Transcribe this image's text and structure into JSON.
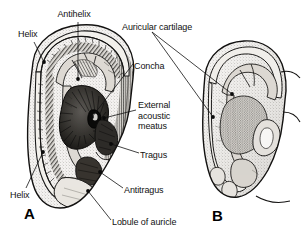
{
  "figure": {
    "background_color": "#ffffff",
    "ink_color": "#111111",
    "width": 305,
    "height": 247
  },
  "panels": [
    {
      "id": "A",
      "letter": "A",
      "caption": "A",
      "view": "lateral surface of auricle with skin removed showing cartilage relief"
    },
    {
      "id": "B",
      "letter": "B",
      "caption": "B",
      "view": "auricular cartilage isolated"
    }
  ],
  "labels": [
    {
      "id": "antihelix",
      "text": "Antihelix",
      "x": 74,
      "y": 9,
      "align": "center"
    },
    {
      "id": "helix-top",
      "text": "Helix",
      "x": 18,
      "y": 29,
      "align": "left"
    },
    {
      "id": "auricular-cartilage",
      "text": "Auricular cartilage",
      "x": 122,
      "y": 22,
      "align": "left"
    },
    {
      "id": "concha",
      "text": "Concha",
      "x": 134,
      "y": 61,
      "align": "left"
    },
    {
      "id": "external-acoustic-meatus",
      "text": "External\nacoustic\nmeatus",
      "x": 138,
      "y": 100,
      "align": "left"
    },
    {
      "id": "tragus",
      "text": "Tragus",
      "x": 140,
      "y": 150,
      "align": "left"
    },
    {
      "id": "antitragus",
      "text": "Antitragus",
      "x": 124,
      "y": 185,
      "align": "left"
    },
    {
      "id": "helix-bottom",
      "text": "Helix",
      "x": 10,
      "y": 190,
      "align": "left"
    },
    {
      "id": "lobule-of-auricle",
      "text": "Lobule of auricle",
      "x": 112,
      "y": 217,
      "align": "left"
    }
  ],
  "leaders": [
    {
      "id": "leader-antihelix",
      "from": [
        78,
        22
      ],
      "to": [
        78,
        79
      ],
      "dot": [
        78,
        79
      ]
    },
    {
      "id": "leader-helix-top",
      "from": [
        34,
        42
      ],
      "to": [
        44,
        62
      ],
      "dot": [
        44,
        62
      ]
    },
    {
      "id": "leader-helix-bottom",
      "from": [
        26,
        188
      ],
      "to": [
        43,
        152
      ],
      "dot": [
        43,
        152
      ]
    },
    {
      "id": "leader-concha",
      "from": [
        133,
        64
      ],
      "to": [
        92,
        117
      ],
      "dot": [
        92,
        117
      ]
    },
    {
      "id": "leader-meatus",
      "from": [
        136,
        110
      ],
      "to": [
        104,
        118
      ],
      "dot": [
        104,
        118
      ]
    },
    {
      "id": "leader-tragus",
      "from": [
        139,
        153
      ],
      "to": [
        111,
        144
      ],
      "dot": [
        111,
        144
      ]
    },
    {
      "id": "leader-antitragus",
      "from": [
        123,
        188
      ],
      "to": [
        100,
        172
      ],
      "dot": [
        100,
        172
      ]
    },
    {
      "id": "leader-lobule",
      "from": [
        111,
        220
      ],
      "to": [
        88,
        191
      ],
      "dot": [
        88,
        191
      ]
    },
    {
      "id": "leader-cartilage-1",
      "from": [
        152,
        32
      ],
      "to": [
        232,
        94
      ],
      "dot": [
        232,
        94
      ]
    },
    {
      "id": "leader-cartilage-2",
      "from": [
        152,
        32
      ],
      "to": [
        213,
        117
      ],
      "dot": [
        213,
        117
      ]
    }
  ],
  "colors": {
    "ink": "#111111",
    "line": "#1a1a1a",
    "fill_light": "#e8e6e2",
    "fill_mid": "#c9c6c0",
    "fill_dark": "#8d8a85",
    "shadow": "#3a3834",
    "paper": "#ffffff"
  }
}
